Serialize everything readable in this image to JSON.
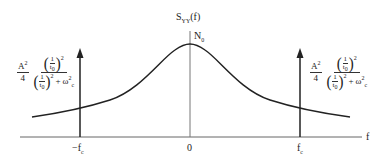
{
  "figure": {
    "y_axis_label": "S",
    "y_axis_label_sub": "YY",
    "y_axis_label_arg": "(f)",
    "peak_label": "N",
    "peak_label_sub": "0",
    "x_axis_label": "f",
    "ticks": {
      "neg_fc": "−f",
      "neg_fc_sub": "c",
      "zero": "0",
      "pos_fc": "f",
      "pos_fc_sub": "c"
    },
    "impulse_amplitude": {
      "coef_num": "A",
      "coef_num_sup": "2",
      "coef_den": "4",
      "paren_open": "(",
      "paren_close": ")",
      "inner_num": "1",
      "inner_den": "t",
      "inner_den_sub": "0",
      "square": "2",
      "plus": "+",
      "omega": "ω",
      "omega_sub": "c",
      "omega_sup": "2"
    },
    "colors": {
      "curve": "#222222",
      "axis": "#555555",
      "impulse": "#222222"
    }
  }
}
